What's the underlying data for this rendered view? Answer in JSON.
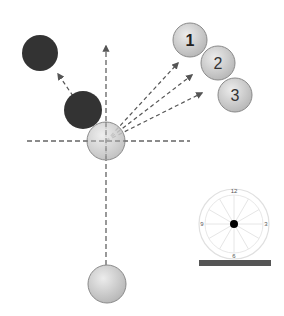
{
  "diagram": {
    "title": "",
    "colors": {
      "dashed_line": "#555555",
      "ball_light_fill_top": "#e8e8e8",
      "ball_light_fill_bottom": "#b8b8b8",
      "ball_light_stroke": "#8a8a8a",
      "ball_dark": "#333333",
      "clock_stroke": "#e0e0e0",
      "clock_center": "#000000",
      "bar": "#555555"
    },
    "balls": {
      "cue_start": {
        "label": "",
        "x": 107,
        "y": 284,
        "r": 19,
        "style": "light"
      },
      "cue_contact": {
        "label": "",
        "x": 106,
        "y": 141,
        "r": 19,
        "style": "light"
      },
      "dark_near": {
        "label": "",
        "x": 83,
        "y": 110,
        "r": 19,
        "style": "dark"
      },
      "dark_far": {
        "label": "",
        "x": 40,
        "y": 53,
        "r": 18,
        "style": "dark"
      },
      "numbered": [
        {
          "label": "1",
          "x": 190,
          "y": 40,
          "r": 17
        },
        {
          "label": "2",
          "x": 218,
          "y": 63,
          "r": 17
        },
        {
          "label": "3",
          "x": 235,
          "y": 95,
          "r": 17
        }
      ]
    },
    "clock": {
      "cx": 234,
      "cy": 224,
      "r_outer": 35,
      "r_inner": 29,
      "labels": {
        "top": "12",
        "right": "3",
        "bottom": "6",
        "left": "9"
      }
    },
    "bar": {
      "x": 199,
      "y": 260,
      "w": 72,
      "h": 6
    }
  }
}
